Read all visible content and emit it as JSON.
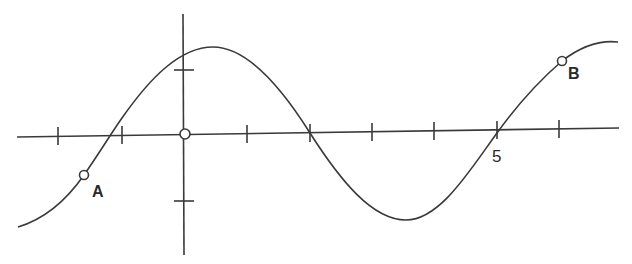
{
  "diagram": {
    "type": "sinusoidal-graph",
    "colors": {
      "stroke": "#3a3a3a",
      "background": "#ffffff",
      "point_fill": "#ffffff"
    },
    "axes": {
      "x_axis": {
        "from": [
          17,
          137
        ],
        "to": [
          619,
          128
        ]
      },
      "y_axis": {
        "from": [
          183,
          14
        ],
        "to": [
          184,
          255
        ]
      },
      "origin": [
        185,
        134
      ]
    },
    "x_ticks": [
      {
        "x": 58,
        "y": 136
      },
      {
        "x": 122,
        "y": 135
      },
      {
        "x": 247,
        "y": 134
      },
      {
        "x": 310,
        "y": 133
      },
      {
        "x": 372,
        "y": 132
      },
      {
        "x": 434,
        "y": 131
      },
      {
        "x": 497,
        "y": 130
      },
      {
        "x": 559,
        "y": 129
      }
    ],
    "y_ticks": [
      {
        "x": 184,
        "y": 70
      },
      {
        "x": 184,
        "y": 201
      }
    ],
    "tick_label": {
      "text": "5",
      "x": 492,
      "y": 147
    },
    "points": [
      {
        "name": "A",
        "label": "A",
        "x": 84,
        "y": 175,
        "label_x": 92,
        "label_y": 183
      },
      {
        "name": "B",
        "label": "B",
        "x": 562,
        "y": 61,
        "label_x": 568,
        "label_y": 65
      }
    ],
    "curve_path": "M18,227 C48,218 68,198 84,175 C100,152 112,132 122,118 C150,78 180,47 213,47 C248,47 283,90 310,133 C340,180 372,220 406,220 C440,220 470,170 497,133 C520,101 540,80 562,61 C580,47 600,40 618,42"
  }
}
